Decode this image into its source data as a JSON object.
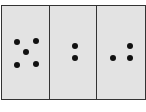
{
  "figure": {
    "background_color": "#e3e3e3",
    "border_color": "#333333",
    "dot_color": "#111111",
    "panels": [
      {
        "id": "panel-1",
        "dot_count": 5,
        "left": 0,
        "width": 49,
        "dots": [
          {
            "x": 15,
            "y": 36
          },
          {
            "x": 34,
            "y": 35
          },
          {
            "x": 24,
            "y": 46
          },
          {
            "x": 15,
            "y": 59
          },
          {
            "x": 34,
            "y": 58
          }
        ]
      },
      {
        "id": "panel-2",
        "dot_count": 2,
        "left": 48,
        "width": 48,
        "dots": [
          {
            "x": 25,
            "y": 40
          },
          {
            "x": 25,
            "y": 52
          }
        ]
      },
      {
        "id": "panel-3",
        "dot_count": 3,
        "left": 95,
        "width": 49,
        "dots": [
          {
            "x": 33,
            "y": 40
          },
          {
            "x": 16,
            "y": 52
          },
          {
            "x": 33,
            "y": 52
          }
        ]
      }
    ]
  }
}
